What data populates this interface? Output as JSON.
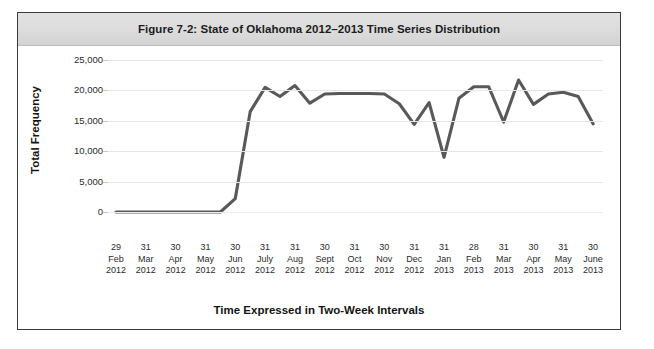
{
  "figure": {
    "title": "Figure 7-2: State of Oklahoma 2012–2013 Time Series Distribution"
  },
  "chart_data": {
    "type": "line",
    "title": "Figure 7-2: State of Oklahoma 2012–2013 Time Series Distribution",
    "xlabel": "Time Expressed in Two-Week Intervals",
    "ylabel": "Total Frequency",
    "ylim": [
      0,
      25000
    ],
    "yticks": [
      0,
      5000,
      10000,
      15000,
      20000,
      25000
    ],
    "ytick_labels": [
      "0",
      "5,000",
      "10,000",
      "15,000",
      "20,000",
      "25,000"
    ],
    "grid": true,
    "legend": "none",
    "line_color": "#595959",
    "x_tick_labels": [
      {
        "day": "29",
        "month": "Feb",
        "year": "2012"
      },
      {
        "day": "31",
        "month": "Mar",
        "year": "2012"
      },
      {
        "day": "30",
        "month": "Apr",
        "year": "2012"
      },
      {
        "day": "31",
        "month": "May",
        "year": "2012"
      },
      {
        "day": "30",
        "month": "Jun",
        "year": "2012"
      },
      {
        "day": "31",
        "month": "July",
        "year": "2012"
      },
      {
        "day": "31",
        "month": "Aug",
        "year": "2012"
      },
      {
        "day": "30",
        "month": "Sept",
        "year": "2012"
      },
      {
        "day": "31",
        "month": "Oct",
        "year": "2012"
      },
      {
        "day": "30",
        "month": "Nov",
        "year": "2012"
      },
      {
        "day": "31",
        "month": "Dec",
        "year": "2012"
      },
      {
        "day": "31",
        "month": "Jan",
        "year": "2013"
      },
      {
        "day": "28",
        "month": "Feb",
        "year": "2013"
      },
      {
        "day": "31",
        "month": "Mar",
        "year": "2013"
      },
      {
        "day": "30",
        "month": "Apr",
        "year": "2013"
      },
      {
        "day": "31",
        "month": "May",
        "year": "2013"
      },
      {
        "day": "30",
        "month": "June",
        "year": "2013"
      }
    ],
    "x": [
      0,
      1,
      2,
      3,
      4,
      5,
      6,
      7,
      8,
      9,
      10,
      11,
      12,
      13,
      14,
      15,
      16,
      17,
      18,
      19,
      20,
      21,
      22,
      23,
      24,
      25,
      26,
      27,
      28,
      29,
      30,
      31,
      32
    ],
    "values": [
      0,
      0,
      0,
      0,
      0,
      0,
      0,
      0,
      2200,
      16500,
      20500,
      19000,
      20800,
      17900,
      19400,
      19500,
      19500,
      19500,
      19400,
      17800,
      14400,
      18000,
      9000,
      18700,
      20600,
      20600,
      14800,
      21700,
      17700,
      19400,
      19700,
      19000,
      14500
    ]
  }
}
